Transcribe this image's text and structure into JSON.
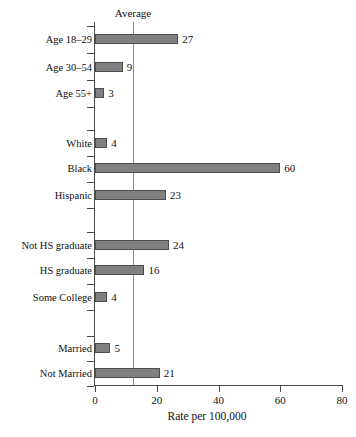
{
  "chart_data": {
    "type": "bar",
    "orientation": "horizontal",
    "title": "",
    "xlabel": "Rate per 100,000",
    "ylabel": "",
    "xlim": [
      0,
      80
    ],
    "xticks": [
      0,
      20,
      40,
      60,
      80
    ],
    "grid": false,
    "legend": null,
    "annotations": [
      {
        "name": "average-line",
        "label": "Average",
        "value": 12.3
      }
    ],
    "categories": [
      "Age 18–29",
      "Age 30–54",
      "Age 55+",
      "White",
      "Black",
      "Hispanic",
      "Not HS graduate",
      "HS graduate",
      "Some College",
      "Married",
      "Not Married"
    ],
    "values": [
      27,
      9,
      3,
      4,
      60,
      23,
      24,
      16,
      4,
      5,
      21
    ],
    "value_labels": [
      "27",
      "9",
      "3",
      "4",
      "60",
      "23",
      "24",
      "16",
      "4",
      "5",
      "21"
    ],
    "groups": [
      {
        "name": "age",
        "categories": [
          "Age 18–29",
          "Age 30–54",
          "Age 55+"
        ]
      },
      {
        "name": "race-ethnicity",
        "categories": [
          "White",
          "Black",
          "Hispanic"
        ]
      },
      {
        "name": "education",
        "categories": [
          "Not HS graduate",
          "HS graduate",
          "Some College"
        ]
      },
      {
        "name": "marital-status",
        "categories": [
          "Married",
          "Not Married"
        ]
      }
    ],
    "bar_color": "#808080",
    "bar_edge_color": "#4d4d4d",
    "axis_color": "#4a4a4a",
    "average_line_color": "#8c8c8c"
  },
  "xtick_labels": [
    "0",
    "20",
    "40",
    "60",
    "80"
  ],
  "average": {
    "label": "Average"
  },
  "axis": {
    "xtitle": "Rate per 100,000"
  }
}
